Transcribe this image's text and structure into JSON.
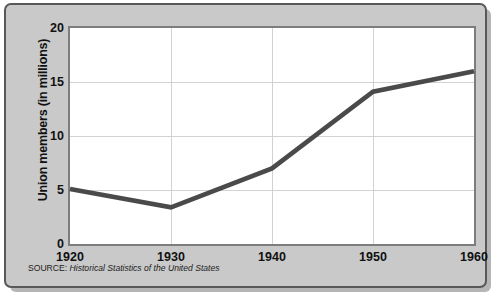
{
  "chart_data": {
    "type": "line",
    "title": "",
    "xlabel": "",
    "ylabel": "Union members (in millions)",
    "x": [
      1920,
      1930,
      1940,
      1950,
      1960
    ],
    "values": [
      5.1,
      3.4,
      7.0,
      14.1,
      16.0
    ],
    "series": [
      {
        "name": "Union members",
        "values": [
          5.1,
          3.4,
          7.0,
          14.1,
          16.0
        ]
      }
    ],
    "xlim": [
      1920,
      1960
    ],
    "ylim": [
      0,
      20
    ],
    "xticks": [
      "1920",
      "1930",
      "1940",
      "1950",
      "1960"
    ],
    "yticks": [
      "0",
      "5",
      "10",
      "15",
      "20"
    ],
    "ytick_values": [
      0,
      5,
      10,
      15,
      20
    ],
    "grid": "both",
    "legend": "none",
    "line_color": "#4a4a4a",
    "plot_background": "#ffffff",
    "panel_background": "#c9c9c9",
    "grid_color": "#d2d2d2"
  },
  "source": {
    "label": "SOURCE:",
    "title": "Historical Statistics of the United States"
  }
}
